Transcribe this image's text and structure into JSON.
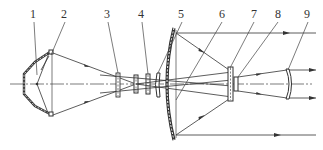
{
  "figure": {
    "type": "optical-system-diagram",
    "colors": {
      "line": "#333333",
      "background": "#ffffff"
    },
    "labels": [
      {
        "id": "1",
        "text": "1",
        "x": 34,
        "y": 19,
        "target_x": 37,
        "target_y": 75
      },
      {
        "id": "2",
        "text": "2",
        "x": 64,
        "y": 19,
        "target_x": 51,
        "target_y": 55
      },
      {
        "id": "3",
        "text": "3",
        "x": 107,
        "y": 19,
        "target_x": 118,
        "target_y": 72
      },
      {
        "id": "4",
        "text": "4",
        "x": 141,
        "y": 19,
        "target_x": 149,
        "target_y": 72
      },
      {
        "id": "5",
        "text": "5",
        "x": 181,
        "y": 19,
        "target_x": 159,
        "target_y": 72
      },
      {
        "id": "6",
        "text": "6",
        "x": 222,
        "y": 19,
        "target_x": 199,
        "target_y": 62
      },
      {
        "id": "7",
        "text": "7",
        "x": 254,
        "y": 19,
        "target_x": 229,
        "target_y": 70
      },
      {
        "id": "8",
        "text": "8",
        "x": 278,
        "y": 19,
        "target_x": 238,
        "target_y": 75
      },
      {
        "id": "9",
        "text": "9",
        "x": 308,
        "y": 19,
        "target_x": 288,
        "target_y": 72
      }
    ]
  }
}
